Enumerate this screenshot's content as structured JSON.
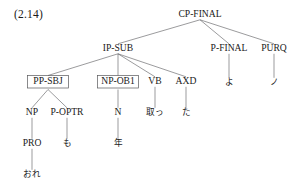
{
  "figure": {
    "example_number": "(2.14)",
    "caption": "",
    "width": 300,
    "height": 191
  },
  "colors": {
    "background": "#ffffff",
    "text": "#1a1a1a",
    "branch": "#58585a",
    "box_border": "#58585a"
  },
  "tree": {
    "type": "constituency-tree",
    "root": "CP-FINAL",
    "nodes": [
      {
        "id": "cp-final",
        "label": "CP-FINAL",
        "x": 200,
        "y": 17,
        "boxed": false,
        "script": "latin",
        "parent": null
      },
      {
        "id": "ip-sub",
        "label": "IP-SUB",
        "x": 118,
        "y": 51,
        "boxed": false,
        "script": "latin",
        "parent": "cp-final"
      },
      {
        "id": "p-final",
        "label": "P-FINAL",
        "x": 229,
        "y": 51,
        "boxed": false,
        "script": "latin",
        "parent": "cp-final"
      },
      {
        "id": "purq",
        "label": "PURQ",
        "x": 274,
        "y": 51,
        "boxed": false,
        "script": "latin",
        "parent": "cp-final"
      },
      {
        "id": "pp-sbj",
        "label": "PP-SBJ",
        "x": 48,
        "y": 84,
        "boxed": true,
        "script": "latin",
        "parent": "ip-sub"
      },
      {
        "id": "np-ob1",
        "label": "NP-OB1",
        "x": 118,
        "y": 84,
        "boxed": true,
        "script": "latin",
        "parent": "ip-sub"
      },
      {
        "id": "vb",
        "label": "VB",
        "x": 155,
        "y": 84,
        "boxed": false,
        "script": "latin",
        "parent": "ip-sub"
      },
      {
        "id": "axd",
        "label": "AXD",
        "x": 186,
        "y": 84,
        "boxed": false,
        "script": "latin",
        "parent": "ip-sub"
      },
      {
        "id": "yo",
        "label": "よ",
        "x": 229,
        "y": 85,
        "boxed": false,
        "script": "jp",
        "parent": "p-final"
      },
      {
        "id": "no",
        "label": "ノ",
        "x": 274,
        "y": 85,
        "boxed": false,
        "script": "jp",
        "parent": "purq"
      },
      {
        "id": "np",
        "label": "NP",
        "x": 32,
        "y": 115,
        "boxed": false,
        "script": "latin",
        "parent": "pp-sbj"
      },
      {
        "id": "p-optr",
        "label": "P-OPTR",
        "x": 67,
        "y": 115,
        "boxed": false,
        "script": "latin",
        "parent": "pp-sbj"
      },
      {
        "id": "n",
        "label": "N",
        "x": 118,
        "y": 115,
        "boxed": false,
        "script": "latin",
        "parent": "np-ob1"
      },
      {
        "id": "totta",
        "label": "取っ",
        "x": 155,
        "y": 115,
        "boxed": false,
        "script": "jp",
        "parent": "vb"
      },
      {
        "id": "ta",
        "label": "た",
        "x": 186,
        "y": 115,
        "boxed": false,
        "script": "jp",
        "parent": "axd"
      },
      {
        "id": "pro",
        "label": "PRO",
        "x": 32,
        "y": 146,
        "boxed": false,
        "script": "latin",
        "parent": "np"
      },
      {
        "id": "mo",
        "label": "も",
        "x": 67,
        "y": 146,
        "boxed": false,
        "script": "jp",
        "parent": "p-optr"
      },
      {
        "id": "toshi",
        "label": "年",
        "x": 118,
        "y": 146,
        "boxed": false,
        "script": "jp",
        "parent": "n"
      },
      {
        "id": "ore",
        "label": "おれ",
        "x": 32,
        "y": 177,
        "boxed": false,
        "script": "jp",
        "parent": "pro"
      }
    ],
    "edges": [
      {
        "from": "cp-final",
        "to": "ip-sub"
      },
      {
        "from": "cp-final",
        "to": "p-final"
      },
      {
        "from": "cp-final",
        "to": "purq"
      },
      {
        "from": "ip-sub",
        "to": "pp-sbj"
      },
      {
        "from": "ip-sub",
        "to": "np-ob1"
      },
      {
        "from": "ip-sub",
        "to": "vb"
      },
      {
        "from": "ip-sub",
        "to": "axd"
      },
      {
        "from": "p-final",
        "to": "yo"
      },
      {
        "from": "purq",
        "to": "no"
      },
      {
        "from": "pp-sbj",
        "to": "np"
      },
      {
        "from": "pp-sbj",
        "to": "p-optr"
      },
      {
        "from": "np-ob1",
        "to": "n"
      },
      {
        "from": "vb",
        "to": "totta"
      },
      {
        "from": "axd",
        "to": "ta"
      },
      {
        "from": "np",
        "to": "pro"
      },
      {
        "from": "p-optr",
        "to": "mo"
      },
      {
        "from": "n",
        "to": "toshi"
      },
      {
        "from": "pro",
        "to": "ore"
      }
    ]
  }
}
